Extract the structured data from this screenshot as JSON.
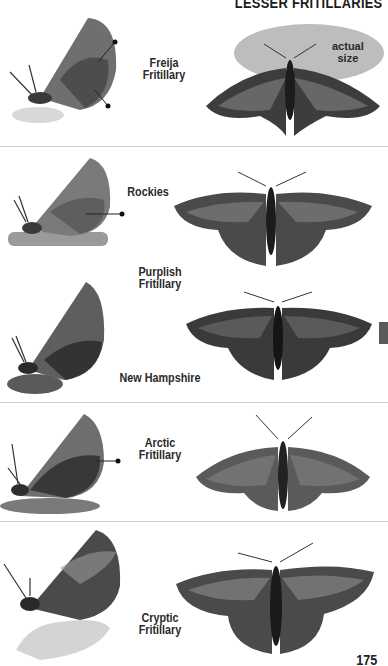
{
  "header": {
    "title": "LESSER FRITILLARIES"
  },
  "actual_size_label": "actual\nsize",
  "species": [
    {
      "name": "Freija Fritillary",
      "line1": "Freija",
      "line2": "Fritillary"
    },
    {
      "name": "Purplish Fritillary",
      "line1": "Purplish",
      "line2": "Fritillary",
      "forms": [
        "Rockies",
        "New Hampshire"
      ]
    },
    {
      "name": "Arctic Fritillary",
      "line1": "Arctic",
      "line2": "Fritillary"
    },
    {
      "name": "Cryptic Fritillary",
      "line1": "Cryptic",
      "line2": "Fritillary"
    }
  ],
  "page_number": "175",
  "colors": {
    "background": "#ffffff",
    "text": "#2a2a2a",
    "divider": "#cfcfcf",
    "tab": "#5a5a5a",
    "actual_size_highlight": "#bdbdbd"
  }
}
